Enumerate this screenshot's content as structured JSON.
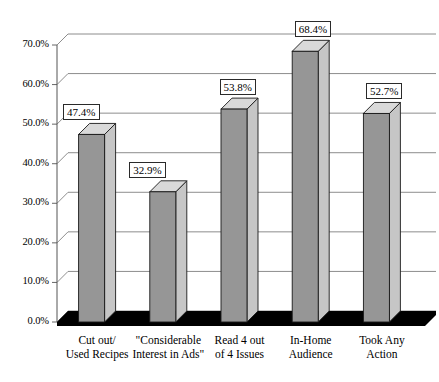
{
  "chart_data": {
    "type": "bar",
    "title": "",
    "subtitle": "",
    "xlabel": "",
    "ylabel": "",
    "ylim": [
      0,
      70
    ],
    "grid": true,
    "legend": null,
    "style": "3d-column-grayscale",
    "categories": [
      "Cut out/\nUsed Recipes",
      "\"Considerable\nInterest in Ads\"",
      "Read 4 out\nof 4 Issues",
      "In-Home\nAudience",
      "Took Any\nAction"
    ],
    "category_lines": [
      [
        "Cut out/",
        "Used Recipes"
      ],
      [
        "\"Considerable",
        "Interest in Ads\""
      ],
      [
        "Read 4 out",
        "of 4 Issues"
      ],
      [
        "In-Home",
        "Audience"
      ],
      [
        "Took Any",
        "Action"
      ]
    ],
    "values": [
      47.4,
      32.9,
      53.8,
      68.4,
      52.7
    ],
    "value_labels": [
      "47.4%",
      "32.9%",
      "53.8%",
      "68.4%",
      "52.7%"
    ],
    "yticks": [
      0,
      10,
      20,
      30,
      40,
      50,
      60,
      70
    ],
    "ytick_labels": [
      "0.0%",
      "10.0%",
      "20.0%",
      "30.0%",
      "40.0%",
      "50.0%",
      "60.0%",
      "70.0%"
    ]
  },
  "colors": {
    "bar_front": "#969696",
    "bar_side": "#c6c6c6",
    "bar_top": "#d9d9d9",
    "outline": "#1a1a1a",
    "gridline": "#808080",
    "axis": "#555555",
    "floor": "#000000",
    "background": "#ffffff",
    "label_box_bg": "#ffffff",
    "label_box_border": "#2a2a2a"
  }
}
